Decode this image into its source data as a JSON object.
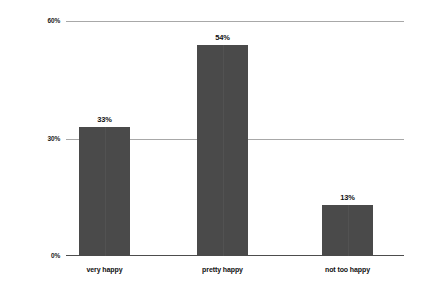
{
  "chart_data": {
    "type": "bar",
    "title": "",
    "subtitle": "",
    "xlabel": "",
    "ylabel": "",
    "categories": [
      "very happy",
      "pretty happy",
      "not too happy"
    ],
    "values": [
      33,
      54,
      13
    ],
    "value_labels": [
      "33%",
      "54%",
      "13%"
    ],
    "ylim": [
      0,
      60
    ],
    "yticks": [
      0,
      30,
      60
    ],
    "ytick_labels": [
      "0%",
      "30%",
      "60%"
    ],
    "grid": true,
    "grid_axis": "y",
    "legend": false,
    "legend_position": "none",
    "bar_color": "#4a4a4a",
    "gridline_color": "#a8a8a8",
    "axis_color": "#4d4d4d",
    "background_color": "#ffffff",
    "text_color": "#111111"
  },
  "axes": {
    "y": {
      "tick_60": "60%",
      "tick_30": "30%",
      "tick_0": "0%"
    }
  },
  "bars": [
    {
      "name": "very-happy",
      "label": "very happy",
      "value_label": "33%"
    },
    {
      "name": "pretty-happy",
      "label": "pretty happy",
      "value_label": "54%"
    },
    {
      "name": "not-too-happy",
      "label": "not too happy",
      "value_label": "13%"
    }
  ]
}
